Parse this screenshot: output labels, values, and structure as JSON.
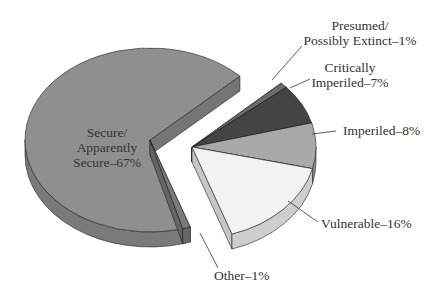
{
  "chart_data": {
    "type": "pie",
    "style": "3d-exploded",
    "title": "",
    "slices": [
      {
        "label": "Secure/ Apparently Secure",
        "value": 67,
        "color": "#8f8f8f"
      },
      {
        "label": "Other",
        "value": 1,
        "color": "#7a7a7a"
      },
      {
        "label": "Vulnerable",
        "value": 16,
        "color": "#f2f2f2"
      },
      {
        "label": "Imperiled",
        "value": 8,
        "color": "#a9a9a9"
      },
      {
        "label": "Critically Imperiled",
        "value": 7,
        "color": "#444444"
      },
      {
        "label": "Presumed/ Possibly Extinct",
        "value": 1,
        "color": "#6a6a6a"
      }
    ],
    "exploded": [
      "Vulnerable",
      "Imperiled",
      "Critically Imperiled",
      "Presumed/ Possibly Extinct"
    ]
  },
  "labels": {
    "secure_1": "Secure/",
    "secure_2": "Apparently",
    "secure_3": "Secure–67%",
    "extinct_1": "Presumed/",
    "extinct_2": "Possibly Extinct–1%",
    "critical_1": "Critically",
    "critical_2": "Imperiled–7%",
    "imperiled": "Imperiled–8%",
    "vulnerable": "Vulnerable–16%",
    "other": "Other–1%"
  }
}
